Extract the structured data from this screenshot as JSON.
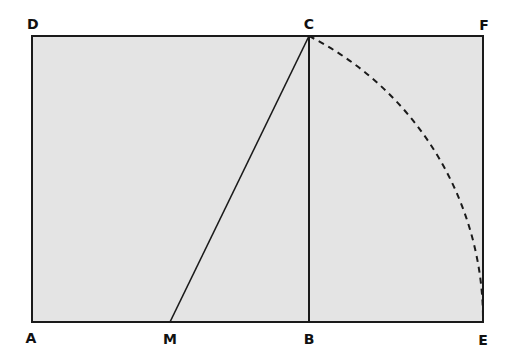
{
  "diagram": {
    "type": "golden-rectangle-construction",
    "fill_color": "#e4e4e4",
    "stroke_color": "#1a1a1a",
    "points": {
      "A": {
        "label": "A",
        "x": 32,
        "y": 322
      },
      "M": {
        "label": "M",
        "x": 170,
        "y": 322
      },
      "B": {
        "label": "B",
        "x": 309,
        "y": 322
      },
      "E": {
        "label": "E",
        "x": 483,
        "y": 322
      },
      "D": {
        "label": "D",
        "x": 32,
        "y": 36
      },
      "C": {
        "label": "C",
        "x": 309,
        "y": 36
      },
      "F": {
        "label": "F",
        "x": 483,
        "y": 36
      }
    },
    "segments": [
      {
        "from": "A",
        "to": "E"
      },
      {
        "from": "D",
        "to": "F"
      },
      {
        "from": "A",
        "to": "D"
      },
      {
        "from": "E",
        "to": "F"
      },
      {
        "from": "B",
        "to": "C"
      },
      {
        "from": "M",
        "to": "C"
      }
    ],
    "arcs": [
      {
        "center": "M",
        "from": "C",
        "to": "E",
        "style": "dashed"
      }
    ]
  }
}
